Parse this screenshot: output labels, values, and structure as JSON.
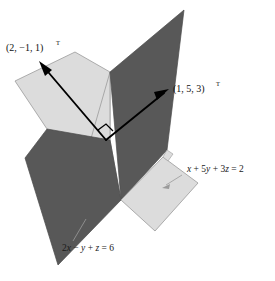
{
  "figure": {
    "background_color": "#ffffff",
    "width": 275,
    "height": 281
  },
  "colors": {
    "dark_plane_fill": "#585858",
    "dark_plane_stroke": "#4a4a4a",
    "light_plane_fill": "#dcdcdc",
    "light_plane_stroke": "#9a9a9a",
    "vector_stroke": "#000000",
    "leader_stroke": "#9a9a9a",
    "text_color": "#111111"
  },
  "planes": [
    {
      "id": "dark-plane",
      "name": "plane-2x-minus-y-plus-z",
      "shade": "dark",
      "equation_label": "2x − y + z = 6",
      "equation_parts": {
        "coef_x": "2",
        "var_x": "x",
        "op1": " − ",
        "var_y": "y",
        "op2": " + ",
        "var_z": "z",
        "equals": " = ",
        "rhs": "6"
      },
      "label_position": {
        "x": 62,
        "y": 249
      },
      "leader_from": {
        "x": 86,
        "y": 219
      },
      "leader_to": {
        "x": 72,
        "y": 240
      }
    },
    {
      "id": "light-plane",
      "name": "plane-x-plus-5y-plus-3z",
      "shade": "light",
      "equation_label": "x + 5y + 3z = 2",
      "equation_parts": {
        "var_x": "x",
        "op1": " + ",
        "coef_y": "5",
        "var_y": "y",
        "op2": " + ",
        "coef_z": "3",
        "var_z": "z",
        "equals": " = ",
        "rhs": "2"
      },
      "label_position": {
        "x": 184,
        "y": 172
      },
      "leader_from": {
        "x": 181,
        "y": 176
      },
      "leader_to": {
        "x": 164,
        "y": 186
      }
    }
  ],
  "vectors": [
    {
      "id": "normal-vector-1",
      "name": "normal-vector-2-minus1-1",
      "label": "(2, −1, 1)",
      "superscript": "T",
      "label_position": {
        "x": 6,
        "y": 51
      },
      "tail": {
        "x": 106,
        "y": 140
      },
      "tip": {
        "x": 39,
        "y": 62
      }
    },
    {
      "id": "normal-vector-2",
      "name": "normal-vector-1-5-3",
      "label": "(1, 5, 3)",
      "superscript": "T",
      "label_position": {
        "x": 173,
        "y": 92
      },
      "tail": {
        "x": 106,
        "y": 140
      },
      "tip": {
        "x": 168,
        "y": 90
      }
    }
  ],
  "right_angle_marker": {
    "name": "right-angle-marker",
    "vertex": {
      "x": 106,
      "y": 140
    },
    "size": 11
  }
}
